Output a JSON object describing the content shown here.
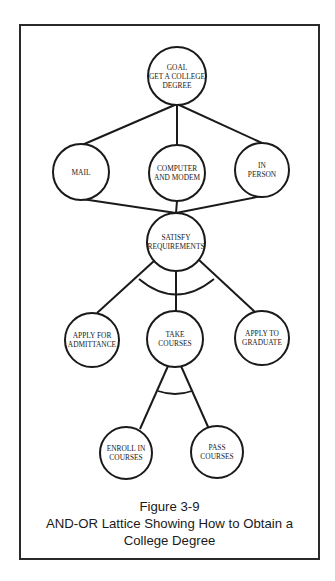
{
  "diagram": {
    "type": "and-or-lattice",
    "nodes": [
      {
        "id": "goal",
        "lines": [
          "GOAL",
          "GET A COLLEGE",
          "DEGREE"
        ],
        "cx": 177,
        "cy": 76,
        "r": 29
      },
      {
        "id": "mail",
        "lines": [
          "MAIL"
        ],
        "cx": 81,
        "cy": 172,
        "r": 28
      },
      {
        "id": "computer",
        "lines": [
          "COMPUTER",
          "AND MODEM"
        ],
        "cx": 177,
        "cy": 173,
        "r": 28
      },
      {
        "id": "in-person",
        "lines": [
          "IN",
          "PERSON"
        ],
        "cx": 262,
        "cy": 170,
        "r": 27
      },
      {
        "id": "satisfy",
        "lines": [
          "SATISFY",
          "REQUIREMENTS"
        ],
        "cx": 176,
        "cy": 242,
        "r": 29
      },
      {
        "id": "apply-admittance",
        "lines": [
          "APPLY FOR",
          "ADMITTANCE"
        ],
        "cx": 92,
        "cy": 340,
        "r": 27
      },
      {
        "id": "take-courses",
        "lines": [
          "TAKE",
          "COURSES"
        ],
        "cx": 175,
        "cy": 339,
        "r": 28
      },
      {
        "id": "apply-graduate",
        "lines": [
          "APPLY TO",
          "GRADUATE"
        ],
        "cx": 262,
        "cy": 338,
        "r": 27
      },
      {
        "id": "enroll",
        "lines": [
          "ENROLL IN",
          "COURSES"
        ],
        "cx": 126,
        "cy": 453,
        "r": 26
      },
      {
        "id": "pass",
        "lines": [
          "PASS",
          "COURSES"
        ],
        "cx": 217,
        "cy": 452,
        "r": 26
      }
    ],
    "edges": [
      {
        "from": "goal",
        "to": "mail",
        "x1": 177,
        "y1": 104,
        "x2": 82,
        "y2": 145
      },
      {
        "from": "goal",
        "to": "computer",
        "x1": 177,
        "y1": 104,
        "x2": 177,
        "y2": 145
      },
      {
        "from": "goal",
        "to": "in-person",
        "x1": 177,
        "y1": 104,
        "x2": 262,
        "y2": 143
      },
      {
        "from": "mail",
        "to": "satisfy",
        "x1": 82,
        "y1": 199,
        "x2": 176,
        "y2": 213
      },
      {
        "from": "computer",
        "to": "satisfy",
        "x1": 177,
        "y1": 201,
        "x2": 176,
        "y2": 213
      },
      {
        "from": "in-person",
        "to": "satisfy",
        "x1": 262,
        "y1": 196,
        "x2": 176,
        "y2": 213
      },
      {
        "from": "satisfy",
        "to": "apply-admittance",
        "x1": 154,
        "y1": 261,
        "x2": 97,
        "y2": 313
      },
      {
        "from": "satisfy",
        "to": "take-courses",
        "x1": 176,
        "y1": 271,
        "x2": 176,
        "y2": 311
      },
      {
        "from": "satisfy",
        "to": "apply-graduate",
        "x1": 199,
        "y1": 260,
        "x2": 255,
        "y2": 312
      },
      {
        "from": "take-courses",
        "to": "enroll",
        "x1": 168,
        "y1": 366,
        "x2": 140,
        "y2": 429
      },
      {
        "from": "take-courses",
        "to": "pass",
        "x1": 181,
        "y1": 366,
        "x2": 209,
        "y2": 429
      }
    ],
    "and_arcs": [
      {
        "id": "and-satisfy",
        "path": "M 139 279 Q 176 310 214 279"
      },
      {
        "id": "and-take-courses",
        "path": "M 158 391 Q 175 397 192 391"
      }
    ]
  },
  "caption": {
    "line1": "Figure 3-9",
    "line2": "AND-OR Lattice Showing How to Obtain a",
    "line3": "College Degree"
  },
  "colors": {
    "stroke": "#1a1a1a",
    "background": "#ffffff",
    "frame": "#2a2a2a"
  }
}
